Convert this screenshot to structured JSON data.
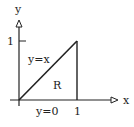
{
  "diagram": {
    "axes": {
      "x_label": "x",
      "y_label": "y"
    },
    "ticks": {
      "x_tick": "1",
      "y_tick": "1"
    },
    "region": {
      "label": "R",
      "boundaries": {
        "diagonal": "y=x",
        "bottom": "y=0",
        "right": "x=1"
      }
    },
    "colors": {
      "stroke": "#222222",
      "background": "#ffffff"
    }
  }
}
